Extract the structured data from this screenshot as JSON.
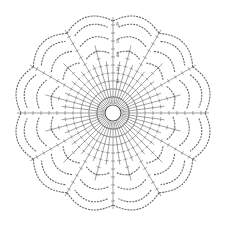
{
  "diagram": {
    "type": "crochet-chart",
    "center": {
      "x": 113,
      "y": 113
    },
    "ring_radius": 8,
    "outer_radius": 98,
    "petal_count": 12,
    "rounds": [
      "1",
      "2",
      "3",
      "4",
      "5",
      "6"
    ],
    "round_label_positions": [
      {
        "label": "2",
        "x": 116,
        "y": 83
      },
      {
        "label": "3",
        "x": 116,
        "y": 71
      },
      {
        "label": "4",
        "x": 116,
        "y": 57
      },
      {
        "label": "5",
        "x": 116,
        "y": 43
      },
      {
        "label": "6",
        "x": 116,
        "y": 26
      }
    ],
    "colors": {
      "line": "#555555",
      "background": "#ffffff"
    }
  }
}
